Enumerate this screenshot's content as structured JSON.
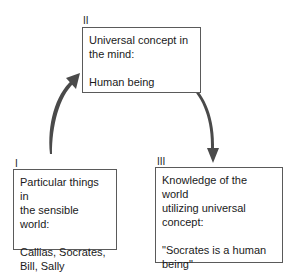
{
  "diagram": {
    "nodes": [
      {
        "id": "I",
        "numeral": "I",
        "heading": [
          "Particular things in",
          "the sensible world:"
        ],
        "content": [
          "Callias, Socrates,",
          "Bill, Sally"
        ]
      },
      {
        "id": "II",
        "numeral": "II",
        "heading": [
          "Universal concept in",
          "the mind:"
        ],
        "content": [
          "Human being"
        ]
      },
      {
        "id": "III",
        "numeral": "III",
        "heading": [
          "Knowledge of the world",
          "utilizing universal",
          "concept:"
        ],
        "content": [
          "\"Socrates is a human",
          "being\""
        ]
      }
    ],
    "edges": [
      {
        "from": "I",
        "to": "II",
        "style": "curved-arrow"
      },
      {
        "from": "II",
        "to": "III",
        "style": "curved-arrow"
      }
    ],
    "colors": {
      "arrow": "#4a4a4a",
      "border": "#5a5a5a",
      "text": "#1a1a1a"
    }
  }
}
